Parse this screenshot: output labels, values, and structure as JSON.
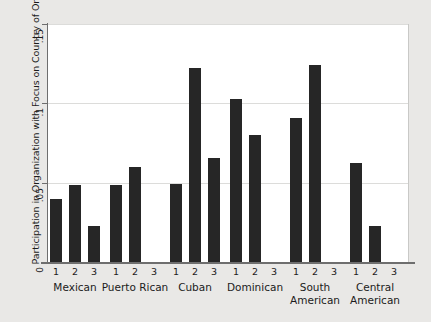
{
  "chart_data": {
    "type": "bar",
    "title": "",
    "xlabel": "",
    "ylabel": "Participation in Organization with Focus on Country of Origin",
    "ylim": [
      0,
      0.15
    ],
    "yticks": [
      0,
      0.05,
      0.1,
      0.15
    ],
    "ytick_labels": [
      "0",
      ".05",
      ".1",
      ".15"
    ],
    "grid": "horizontal",
    "legend": "none",
    "categories": [
      "Mexican",
      "Puerto Rican",
      "Cuban",
      "Dominican",
      "South American",
      "Central American"
    ],
    "group_label_lines": [
      [
        "Mexican"
      ],
      [
        "Puerto Rican"
      ],
      [
        "Cuban"
      ],
      [
        "Dominican"
      ],
      [
        "South",
        "American"
      ],
      [
        "Central",
        "American"
      ]
    ],
    "wave_labels": [
      "1",
      "2",
      "3"
    ],
    "series": [
      {
        "name": "1",
        "values": [
          0.04,
          0.0485,
          0.049,
          0.103,
          0.0905,
          0.0625
        ]
      },
      {
        "name": "2",
        "values": [
          0.0485,
          0.06,
          0.122,
          0.08,
          0.124,
          0.023
        ]
      },
      {
        "name": "3",
        "values": [
          0.023,
          0.0,
          0.0655,
          0.0,
          0.0,
          0.0
        ]
      }
    ],
    "bars": [
      {
        "group": "Mexican",
        "wave": "1",
        "value": 0.04
      },
      {
        "group": "Mexican",
        "wave": "2",
        "value": 0.0485
      },
      {
        "group": "Mexican",
        "wave": "3",
        "value": 0.023
      },
      {
        "group": "Puerto Rican",
        "wave": "1",
        "value": 0.0485
      },
      {
        "group": "Puerto Rican",
        "wave": "2",
        "value": 0.06
      },
      {
        "group": "Puerto Rican",
        "wave": "3",
        "value": 0.0
      },
      {
        "group": "Cuban",
        "wave": "1",
        "value": 0.049
      },
      {
        "group": "Cuban",
        "wave": "2",
        "value": 0.122
      },
      {
        "group": "Cuban",
        "wave": "3",
        "value": 0.0655
      },
      {
        "group": "Dominican",
        "wave": "1",
        "value": 0.103
      },
      {
        "group": "Dominican",
        "wave": "2",
        "value": 0.08
      },
      {
        "group": "Dominican",
        "wave": "3",
        "value": 0.0
      },
      {
        "group": "South American",
        "wave": "1",
        "value": 0.0905
      },
      {
        "group": "South American",
        "wave": "2",
        "value": 0.124
      },
      {
        "group": "South American",
        "wave": "3",
        "value": 0.0
      },
      {
        "group": "Central American",
        "wave": "1",
        "value": 0.0625
      },
      {
        "group": "Central American",
        "wave": "2",
        "value": 0.023
      },
      {
        "group": "Central American",
        "wave": "3",
        "value": 0.0
      }
    ],
    "colors": {
      "bar": "#262626",
      "plot_background": "#ffffff",
      "page_background": "#e9e8e6",
      "gridline": "#dcdcda",
      "axis": "#6e6e6e",
      "text": "#1b1b1b"
    }
  }
}
